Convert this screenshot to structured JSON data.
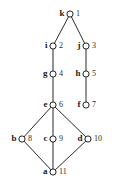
{
  "diagram": {
    "type": "graph-diagram",
    "background_color": "#ffffff",
    "edge_color": "#2b2b2b",
    "node_fill_color": "#ffffff",
    "node_stroke_color": "#222222",
    "label_color": "#1b1b1b",
    "number_color": "#2a2a2a",
    "nodes": [
      {
        "id": "k",
        "label": "k",
        "number": "1",
        "x": 70,
        "y": 14,
        "label_side": "left",
        "number_side": "right"
      },
      {
        "id": "i",
        "label": "i",
        "number": "2",
        "x": 53,
        "y": 46,
        "label_side": "left",
        "number_side": "right"
      },
      {
        "id": "j",
        "label": "j",
        "number": "3",
        "x": 86,
        "y": 46,
        "label_side": "left",
        "number_side": "right"
      },
      {
        "id": "g",
        "label": "g",
        "number": "4",
        "x": 53,
        "y": 74,
        "label_side": "left",
        "number_side": "right"
      },
      {
        "id": "h",
        "label": "h",
        "number": "5",
        "x": 86,
        "y": 74,
        "label_side": "left",
        "number_side": "right"
      },
      {
        "id": "e",
        "label": "e",
        "number": "6",
        "x": 53,
        "y": 105,
        "label_side": "left",
        "number_side": "right"
      },
      {
        "id": "f",
        "label": "f",
        "number": "7",
        "x": 86,
        "y": 105,
        "label_side": "left",
        "number_side": "right"
      },
      {
        "id": "b",
        "label": "b",
        "number": "8",
        "x": 22,
        "y": 139,
        "label_side": "left",
        "number_side": "right"
      },
      {
        "id": "c",
        "label": "c",
        "number": "9",
        "x": 53,
        "y": 139,
        "label_side": "left",
        "number_side": "right"
      },
      {
        "id": "d",
        "label": "d",
        "number": "10",
        "x": 88,
        "y": 139,
        "label_side": "left",
        "number_side": "right"
      },
      {
        "id": "a",
        "label": "a",
        "number": "11",
        "x": 53,
        "y": 172,
        "label_side": "left",
        "number_side": "right"
      }
    ],
    "edges": [
      {
        "from": "k",
        "to": "i"
      },
      {
        "from": "k",
        "to": "j"
      },
      {
        "from": "i",
        "to": "g"
      },
      {
        "from": "j",
        "to": "h"
      },
      {
        "from": "g",
        "to": "e"
      },
      {
        "from": "h",
        "to": "f"
      },
      {
        "from": "e",
        "to": "b"
      },
      {
        "from": "e",
        "to": "c"
      },
      {
        "from": "e",
        "to": "d"
      },
      {
        "from": "b",
        "to": "a"
      },
      {
        "from": "c",
        "to": "a"
      },
      {
        "from": "d",
        "to": "a"
      }
    ]
  }
}
